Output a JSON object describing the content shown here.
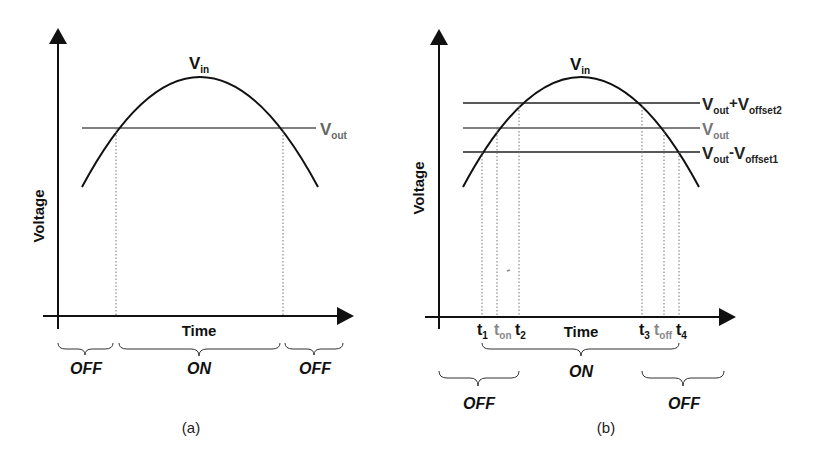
{
  "panels": [
    {
      "id": "a",
      "caption": "(a)",
      "y_axis_label": "Voltage",
      "x_axis_label": "Time",
      "curve_label": {
        "main": "V",
        "sub": "in"
      },
      "threshold_lines": [
        {
          "main": "V",
          "sub": "out",
          "color": "#555555"
        }
      ],
      "regions": [
        {
          "label": "OFF"
        },
        {
          "label": "ON"
        },
        {
          "label": "OFF"
        }
      ]
    },
    {
      "id": "b",
      "caption": "(b)",
      "y_axis_label": "Voltage",
      "x_axis_label": "Time",
      "curve_label": {
        "main": "V",
        "sub": "in"
      },
      "threshold_lines": [
        {
          "main": "V",
          "sub": "out",
          "op": "+",
          "main2": "V",
          "sub2": "offset2",
          "color": "#222222"
        },
        {
          "main": "V",
          "sub": "out",
          "color": "#777777"
        },
        {
          "main": "V",
          "sub": "out",
          "op": "-",
          "main2": "V",
          "sub2": "offset1",
          "color": "#222222"
        }
      ],
      "time_marks": [
        {
          "main": "t",
          "sub": "1",
          "color": "#111111"
        },
        {
          "main": "t",
          "sub": "on",
          "color": "#888888"
        },
        {
          "main": "t",
          "sub": "2",
          "color": "#111111"
        },
        {
          "main": "t",
          "sub": "3",
          "color": "#111111"
        },
        {
          "main": "t",
          "sub": "off",
          "color": "#888888"
        },
        {
          "main": "t",
          "sub": "4",
          "color": "#111111"
        }
      ],
      "regions": [
        {
          "label": "ON"
        },
        {
          "label": "OFF"
        },
        {
          "label": "OFF"
        }
      ]
    }
  ]
}
